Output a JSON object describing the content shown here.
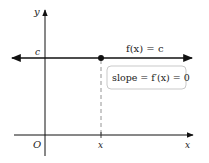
{
  "diagram": {
    "axes": {
      "y_label": "y",
      "x_label": "x",
      "origin_label": "O"
    },
    "constant_line": {
      "level_label": "c",
      "function_label": "f(x) = c",
      "point_x_label": "x"
    },
    "annotation": {
      "text": "slope = f′(x) = 0"
    },
    "colors": {
      "line": "#111111",
      "dashed": "#888888",
      "box_border": "#bbbbbb"
    }
  }
}
